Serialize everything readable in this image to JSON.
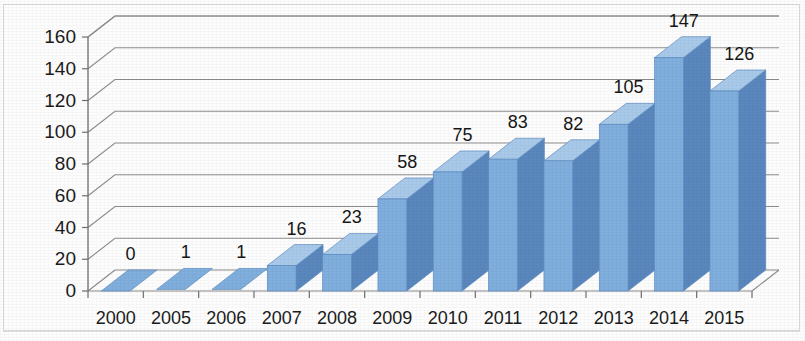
{
  "chart_data": {
    "type": "bar",
    "title": "",
    "subtitle": "",
    "xlabel": "",
    "ylabel": "",
    "categories": [
      "2000",
      "2005",
      "2006",
      "2007",
      "2008",
      "2009",
      "2010",
      "2011",
      "2012",
      "2013",
      "2014",
      "2015"
    ],
    "values": [
      0,
      1,
      1,
      16,
      23,
      58,
      75,
      83,
      82,
      105,
      147,
      126
    ],
    "value_labels": [
      "0",
      "1",
      "1",
      "16",
      "23",
      "58",
      "75",
      "83",
      "82",
      "105",
      "147",
      "126"
    ],
    "ylim": [
      0,
      160
    ],
    "ytick_labels": [
      "0",
      "20",
      "40",
      "60",
      "80",
      "100",
      "120",
      "140",
      "160"
    ],
    "yticks": [
      0,
      20,
      40,
      60,
      80,
      100,
      120,
      140,
      160
    ],
    "grid": true,
    "legend": "none",
    "style": "3d-column",
    "colors": {
      "bar_front": "#80aedd",
      "bar_side": "#5a87bd",
      "bar_top": "#a9c9ea",
      "gridline": "#8d8d8d",
      "axis": "#6f6f6f",
      "text": "#1b1b1b",
      "background": "#fdfdfd",
      "border": "#d8d8d8"
    }
  }
}
